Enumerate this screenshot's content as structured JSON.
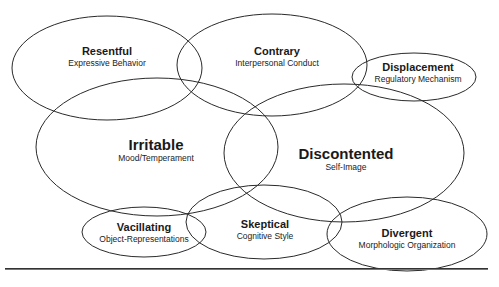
{
  "diagram": {
    "stroke_color": "#2a2a2a",
    "background": "#ffffff",
    "ellipses": [
      {
        "id": "resentful",
        "title": "Resentful",
        "subtitle": "Expressive Behavior",
        "cx": 107,
        "cy": 68,
        "rx": 95,
        "ry": 52,
        "label_x": 107,
        "label_y": 46,
        "size": "small"
      },
      {
        "id": "contrary",
        "title": "Contrary",
        "subtitle": "Interpersonal Conduct",
        "cx": 272,
        "cy": 65,
        "rx": 95,
        "ry": 51,
        "label_x": 277,
        "label_y": 46,
        "size": "small"
      },
      {
        "id": "displacement",
        "title": "Displacement",
        "subtitle": "Regulatory Mechanism",
        "cx": 414,
        "cy": 77,
        "rx": 62,
        "ry": 24,
        "label_x": 418,
        "label_y": 62,
        "size": "small"
      },
      {
        "id": "irritable",
        "title": "Irritable",
        "subtitle": "Mood/Temperament",
        "cx": 157,
        "cy": 147,
        "rx": 121,
        "ry": 69,
        "label_x": 156,
        "label_y": 137,
        "size": "large"
      },
      {
        "id": "discontented",
        "title": "Discontented",
        "subtitle": "Self-Image",
        "cx": 344,
        "cy": 153,
        "rx": 120,
        "ry": 69,
        "label_x": 346,
        "label_y": 146,
        "size": "large"
      },
      {
        "id": "vacillating",
        "title": "Vacillating",
        "subtitle": "Object-Representations",
        "cx": 144,
        "cy": 232,
        "rx": 62,
        "ry": 25,
        "label_x": 144,
        "label_y": 222,
        "size": "small"
      },
      {
        "id": "skeptical",
        "title": "Skeptical",
        "subtitle": "Cognitive Style",
        "cx": 264,
        "cy": 222,
        "rx": 78,
        "ry": 37,
        "label_x": 265,
        "label_y": 219,
        "size": "small"
      },
      {
        "id": "divergent",
        "title": "Divergent",
        "subtitle": "Morphologic Organization",
        "cx": 407,
        "cy": 234,
        "rx": 80,
        "ry": 37,
        "label_x": 407,
        "label_y": 228,
        "size": "small"
      }
    ]
  }
}
